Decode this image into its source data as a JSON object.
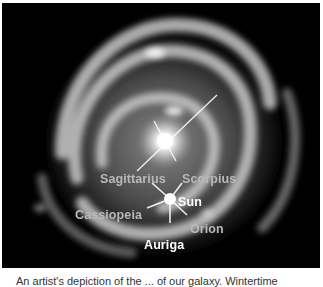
{
  "figure": {
    "labels": {
      "sagittarius": "Sagittarius",
      "scorpius": "Scorpius",
      "sun": "Sun",
      "cassiopeia": "Cassiopeia",
      "orion": "Orion",
      "auriga": "Auriga"
    },
    "colors": {
      "background": "#000000",
      "frame": "#ffffff",
      "label_dim": "#b9b9b9",
      "label_bright": "#ffffff"
    }
  },
  "caption": {
    "text": "An artist's depiction of the ... of our galaxy. Wintertime"
  }
}
